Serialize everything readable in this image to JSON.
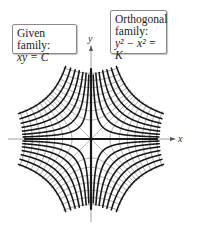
{
  "labels": {
    "given": {
      "title": "Given family:",
      "equation": "xy = C"
    },
    "orthogonal": {
      "title_line1": "Orthogonal",
      "title_line2": "family:",
      "equation": "y² − x² = K"
    },
    "x_axis": "x",
    "y_axis": "y"
  },
  "colors": {
    "given_curves": "#1a1a1a",
    "orthogonal_curves": "#9a9a9a",
    "axes": "#8c8c8c",
    "box_border": "#8a8a8a"
  },
  "chart_data": {
    "type": "line",
    "title": "",
    "xlabel": "x",
    "ylabel": "y",
    "origin_px": [
      91,
      139
    ],
    "scale_px_per_unit": 20,
    "families": [
      {
        "name": "Given family: xy = C",
        "equation": "xy = C",
        "values": [
          0.35,
          0.8,
          1.35,
          2.0,
          2.75,
          3.6,
          4.6
        ],
        "style": "solid-black-thick"
      },
      {
        "name": "Orthogonal family: y² − x² = K",
        "equation": "y^2 - x^2 = K",
        "values": [
          0.9,
          2.0,
          3.3,
          4.8,
          6.6,
          8.6,
          10.8
        ],
        "style": "solid-gray-thin"
      }
    ],
    "region": {
      "max_abs_C": 4.9,
      "max_abs_K": 11.6
    },
    "axis_range_px": {
      "x": [
        8,
        175
      ],
      "y": [
        45,
        222
      ]
    },
    "grid": false,
    "legend": "boxed labels top-left and top-right"
  }
}
